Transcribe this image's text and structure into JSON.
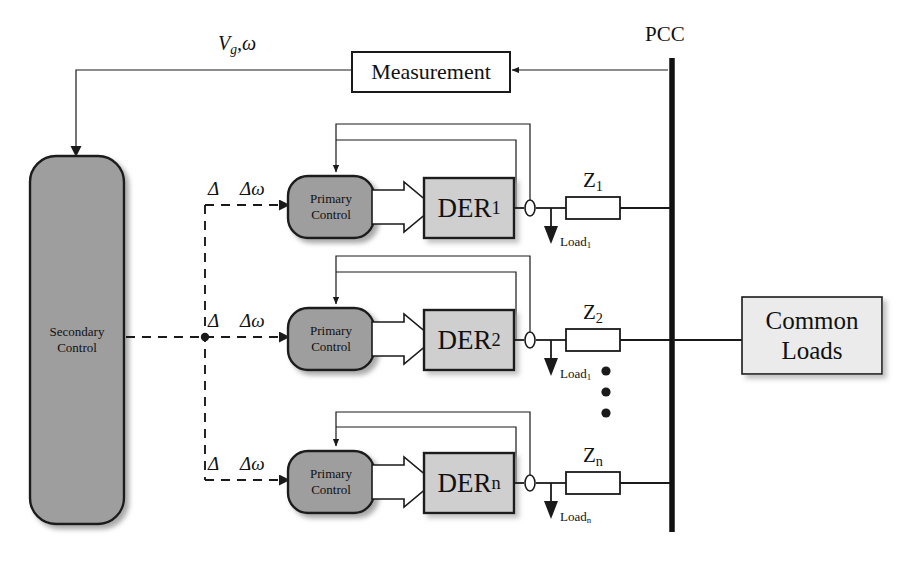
{
  "diagram": {
    "colors": {
      "control_block_fill": "#9e9e9e",
      "der_block_fill": "#cfcfcf",
      "common_loads_fill": "#ebebeb",
      "measurement_fill": "#ffffff",
      "line": "#1a1a1a",
      "bus": "#111111",
      "shadow": "#b5b5b5",
      "background": "#ffffff"
    }
  },
  "labels": {
    "pcc": "PCC",
    "feedback_signal": "Vg,ω",
    "feedback_signal_main": "V",
    "feedback_signal_sub": "g",
    "feedback_signal_tail": ",ω",
    "measurement": "Measurement",
    "secondary_control_line1": "Secondary",
    "secondary_control_line2": "Control",
    "common_loads_line1": "Common",
    "common_loads_line2": "Loads",
    "delta": "Δ",
    "delta_omega": "Δω",
    "primary_control_line1": "Primary",
    "primary_control_line2": "Control",
    "vertical_ellipsis": "⋮"
  },
  "branches": [
    {
      "id": "branch-1",
      "primary_control_line1": "Primary",
      "primary_control_line2": "Control",
      "der_label_main": "DER",
      "der_label_sub": "1",
      "impedance_main": "Z",
      "impedance_sub": "1",
      "load_main": "Load",
      "load_sub": "1",
      "delta": "Δ",
      "delta_omega": "Δω"
    },
    {
      "id": "branch-2",
      "primary_control_line1": "Primary",
      "primary_control_line2": "Control",
      "der_label_main": "DER",
      "der_label_sub": "2",
      "impedance_main": "Z",
      "impedance_sub": "2",
      "load_main": "Load",
      "load_sub": "1",
      "delta": "Δ",
      "delta_omega": "Δω"
    },
    {
      "id": "branch-n",
      "primary_control_line1": "Primary",
      "primary_control_line2": "Control",
      "der_label_main": "DER",
      "der_label_sub": "n",
      "impedance_main": "Z",
      "impedance_sub": "n",
      "load_main": "Load",
      "load_sub": "n",
      "delta": "Δ",
      "delta_omega": "Δω"
    }
  ]
}
